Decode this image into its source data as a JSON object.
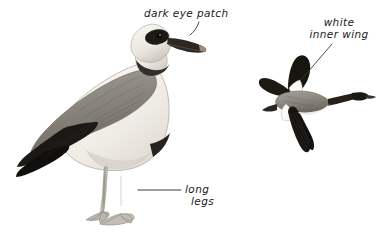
{
  "plate": {
    "width": 387,
    "height": 235,
    "background_color": "#ffffff",
    "subject": "Egyptian Goose field guide plate",
    "style": "pencil and wash illustration with handwritten annotations"
  },
  "annotations": [
    {
      "id": "dark-eye-patch",
      "text": "dark eye patch",
      "lines": [
        "dark eye patch"
      ],
      "points_to": "standing-bird-head",
      "leader": "curved"
    },
    {
      "id": "white-inner-wing",
      "text": "white inner wing",
      "lines": [
        "white",
        "inner wing"
      ],
      "points_to": "flying-bird-wing",
      "leader": "diagonal"
    },
    {
      "id": "long-legs",
      "text": "long legs",
      "lines": [
        "long",
        "legs"
      ],
      "points_to": "standing-bird-legs",
      "leader": "horizontal"
    }
  ],
  "figures": [
    {
      "id": "standing-bird",
      "name": "Egyptian Goose standing, side view facing right",
      "parts": [
        {
          "name": "head",
          "color": "#efece7"
        },
        {
          "name": "dark-eye-patch",
          "color": "#1e1c1a"
        },
        {
          "name": "bill",
          "color": "#2a2724"
        },
        {
          "name": "bill-tip",
          "color": "#b08c80"
        },
        {
          "name": "neck-collar",
          "color": "#2f2c28"
        },
        {
          "name": "breast",
          "color": "#f4f1ec"
        },
        {
          "name": "mantle-wing",
          "color": "#8c8880"
        },
        {
          "name": "wing-coverts",
          "color": "#7a756d"
        },
        {
          "name": "primaries",
          "color": "#161412"
        },
        {
          "name": "tail",
          "color": "#1a1816"
        },
        {
          "name": "flank",
          "color": "#d9d4cc"
        },
        {
          "name": "legs",
          "color": "#a9a49c"
        },
        {
          "name": "feet",
          "color": "#b5b0a8"
        }
      ]
    },
    {
      "id": "flying-bird",
      "name": "Egyptian Goose in flight, upper wing shown",
      "parts": [
        {
          "name": "upper-wing",
          "color": "#17150f"
        },
        {
          "name": "white-inner-wing-patch",
          "color": "#fcfbf8"
        },
        {
          "name": "body",
          "color": "#8d8982"
        },
        {
          "name": "head-neck",
          "color": "#232019"
        },
        {
          "name": "lower-wing-primaries",
          "color": "#1b1814"
        },
        {
          "name": "belly",
          "color": "#f0ede7"
        }
      ]
    }
  ],
  "colors": {
    "ink": "#1a1a1a",
    "leader_line": "#3a3a3a",
    "paper": "#ffffff",
    "mid_gray": "#8c8880",
    "dark": "#161412"
  }
}
